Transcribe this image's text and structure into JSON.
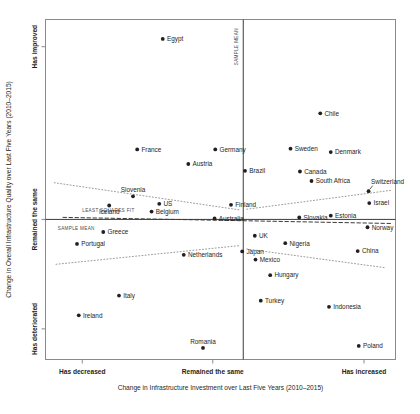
{
  "chart_data": {
    "type": "scatter",
    "title": "",
    "xlabel": "Change in Infrastructure Investment over Last Five Years (2010–2015)",
    "ylabel": "Change in Overall Infrastructure Quality over Last Five Years (2010–2015)",
    "xticklabels": [
      "Has decreased",
      "Remained the same",
      "Has increased"
    ],
    "yticklabels": [
      "Has improved",
      "Remained the same",
      "Has deteriorated"
    ],
    "xlim": [
      0,
      100
    ],
    "ylim": [
      0,
      100
    ],
    "grid": false,
    "legend": null,
    "annotations": [
      {
        "text": "LEAST SQUARES FIT",
        "x": 10.5,
        "y": 43.5
      },
      {
        "text": "SAMPLE MEAN",
        "x": 3.5,
        "y": 38.0
      },
      {
        "text": "SAMPLE MEAN",
        "x": 56.2,
        "y": 92.0,
        "orientation": "vertical"
      }
    ],
    "reference_lines": {
      "x_sample_mean": 56.5,
      "y_sample_mean": 41.2
    },
    "points": [
      {
        "name": "Egypt",
        "x": 33.5,
        "y": 94.3,
        "label_pos": "right"
      },
      {
        "name": "France",
        "x": 26.2,
        "y": 61.8,
        "label_pos": "right"
      },
      {
        "name": "Germany",
        "x": 48.5,
        "y": 61.8,
        "label_pos": "right"
      },
      {
        "name": "Austria",
        "x": 40.8,
        "y": 57.5,
        "label_pos": "right"
      },
      {
        "name": "Chile",
        "x": 78.5,
        "y": 72.4,
        "label_pos": "right"
      },
      {
        "name": "Sweden",
        "x": 70.0,
        "y": 62.0,
        "label_pos": "right"
      },
      {
        "name": "Denmark",
        "x": 81.5,
        "y": 61.0,
        "label_pos": "right"
      },
      {
        "name": "Brazil",
        "x": 57.0,
        "y": 55.5,
        "label_pos": "right"
      },
      {
        "name": "Canada",
        "x": 72.7,
        "y": 55.3,
        "label_pos": "right"
      },
      {
        "name": "South Africa",
        "x": 76.0,
        "y": 52.5,
        "label_pos": "right"
      },
      {
        "name": "Switzerland",
        "x": 92.3,
        "y": 49.5,
        "label_pos": "leader"
      },
      {
        "name": "Israel",
        "x": 92.5,
        "y": 46.0,
        "label_pos": "right"
      },
      {
        "name": "Slovenia",
        "x": 25.0,
        "y": 48.0,
        "label_pos": "above"
      },
      {
        "name": "Iceland",
        "x": 18.2,
        "y": 45.3,
        "label_pos": "below"
      },
      {
        "name": "US",
        "x": 32.5,
        "y": 45.8,
        "label_pos": "right"
      },
      {
        "name": "Belgium",
        "x": 30.3,
        "y": 43.5,
        "label_pos": "right"
      },
      {
        "name": "Finland",
        "x": 53.0,
        "y": 45.5,
        "label_pos": "right"
      },
      {
        "name": "Australia",
        "x": 48.3,
        "y": 41.5,
        "label_pos": "right"
      },
      {
        "name": "Slovakia",
        "x": 72.5,
        "y": 41.8,
        "label_pos": "right"
      },
      {
        "name": "Estonia",
        "x": 81.5,
        "y": 42.3,
        "label_pos": "right"
      },
      {
        "name": "Norway",
        "x": 92.0,
        "y": 38.9,
        "label_pos": "right"
      },
      {
        "name": "Greece",
        "x": 16.5,
        "y": 37.5,
        "label_pos": "right"
      },
      {
        "name": "UK",
        "x": 59.8,
        "y": 36.4,
        "label_pos": "right"
      },
      {
        "name": "Nigeria",
        "x": 68.5,
        "y": 34.2,
        "label_pos": "right"
      },
      {
        "name": "Portugal",
        "x": 9.0,
        "y": 34.0,
        "label_pos": "right"
      },
      {
        "name": "Japan",
        "x": 56.2,
        "y": 31.8,
        "label_pos": "right"
      },
      {
        "name": "China",
        "x": 89.2,
        "y": 31.9,
        "label_pos": "right"
      },
      {
        "name": "Mexico",
        "x": 60.0,
        "y": 29.4,
        "label_pos": "right"
      },
      {
        "name": "Netherlands",
        "x": 39.5,
        "y": 30.8,
        "label_pos": "right"
      },
      {
        "name": "Hungary",
        "x": 64.2,
        "y": 24.8,
        "label_pos": "right"
      },
      {
        "name": "Italy",
        "x": 21.0,
        "y": 18.8,
        "label_pos": "right"
      },
      {
        "name": "Turkey",
        "x": 61.5,
        "y": 17.3,
        "label_pos": "right"
      },
      {
        "name": "Indonesia",
        "x": 81.0,
        "y": 15.5,
        "label_pos": "right"
      },
      {
        "name": "Ireland",
        "x": 9.5,
        "y": 13.0,
        "label_pos": "right"
      },
      {
        "name": "Romania",
        "x": 45.0,
        "y": 3.4,
        "label_pos": "above"
      },
      {
        "name": "Poland",
        "x": 89.5,
        "y": 4.0,
        "label_pos": "right"
      }
    ],
    "fit_lines": [
      {
        "name": "upper-left-fit",
        "points": [
          [
            2.5,
            52.0
          ],
          [
            55.5,
            44.0
          ]
        ]
      },
      {
        "name": "upper-right-fit",
        "points": [
          [
            57.5,
            44.2
          ],
          [
            99.0,
            49.8
          ]
        ]
      },
      {
        "name": "lower-left-fit",
        "points": [
          [
            3.0,
            28.0
          ],
          [
            55.5,
            33.5
          ]
        ]
      },
      {
        "name": "lower-right-fit",
        "points": [
          [
            57.5,
            32.5
          ],
          [
            97.0,
            27.0
          ]
        ]
      },
      {
        "name": "least-squares-dashed",
        "points": [
          [
            5.0,
            41.8
          ],
          [
            99.0,
            40.0
          ]
        ]
      }
    ]
  }
}
